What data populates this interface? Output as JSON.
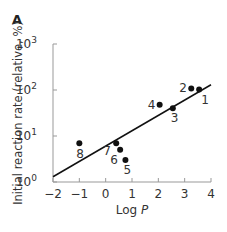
{
  "panel_label": "A",
  "chart_data": {
    "type": "scatter",
    "title": "",
    "panel": "A",
    "xlabel": "Log P",
    "xlabel_plain": "Log ",
    "xlabel_italic": "P",
    "ylabel": "Initial reaction rate (relative, %)",
    "xlim": [
      -2,
      4
    ],
    "ylim": [
      1,
      1000
    ],
    "yscale": "log",
    "grid": false,
    "legend": null,
    "x_ticks": [
      "−2",
      "−1",
      "0",
      "1",
      "2",
      "3",
      "4"
    ],
    "x_tick_values": [
      -2,
      -1,
      0,
      1,
      2,
      3,
      4
    ],
    "y_ticks": [
      {
        "base": "10",
        "exp": "0",
        "value": 1
      },
      {
        "base": "10",
        "exp": "1",
        "value": 10
      },
      {
        "base": "10",
        "exp": "2",
        "value": 100
      },
      {
        "base": "10",
        "exp": "3",
        "value": 1000
      }
    ],
    "points": [
      {
        "label": "1",
        "x": 3.55,
        "y": 102,
        "label_dx": 2,
        "label_dy": 14
      },
      {
        "label": "2",
        "x": 3.25,
        "y": 108,
        "label_dx": -12,
        "label_dy": 4
      },
      {
        "label": "3",
        "x": 2.55,
        "y": 40,
        "label_dx": -2,
        "label_dy": 14
      },
      {
        "label": "4",
        "x": 2.05,
        "y": 48,
        "label_dx": -12,
        "label_dy": 4
      },
      {
        "label": "5",
        "x": 0.75,
        "y": 3,
        "label_dx": -2,
        "label_dy": 14
      },
      {
        "label": "6",
        "x": 0.55,
        "y": 5,
        "label_dx": -10,
        "label_dy": 14
      },
      {
        "label": "7",
        "x": 0.4,
        "y": 7,
        "label_dx": -13,
        "label_dy": 12
      },
      {
        "label": "8",
        "x": -1.0,
        "y": 7,
        "label_dx": -3,
        "label_dy": 15
      }
    ],
    "fit_line": {
      "x": [
        -2,
        4
      ],
      "y": [
        1.3,
        130
      ]
    }
  }
}
